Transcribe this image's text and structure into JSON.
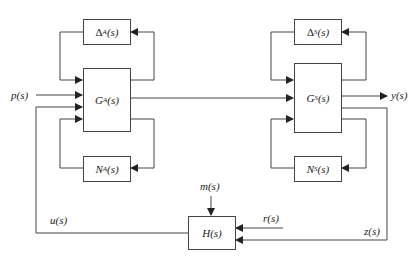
{
  "diagram": {
    "type": "block-diagram",
    "blocks": {
      "delta_a": {
        "prefix": "Δ",
        "sub": "A",
        "suffix": "(s)"
      },
      "g_a": {
        "prefix": "G",
        "sub": "A",
        "suffix": "(s)"
      },
      "n_a": {
        "prefix": "N",
        "sub": "A",
        "suffix": "(s)"
      },
      "delta_s": {
        "prefix": "Δ",
        "sub": "S",
        "suffix": "(s)"
      },
      "g_s": {
        "prefix": "G",
        "sub": "S",
        "suffix": "(s)"
      },
      "n_s": {
        "prefix": "N",
        "sub": "S",
        "suffix": "(s)"
      },
      "h": {
        "label": "H(s)"
      }
    },
    "signals": {
      "p": "p(s)",
      "y": "y(s)",
      "u": "u(s)",
      "m": "m(s)",
      "r": "r(s)",
      "z": "z(s)"
    },
    "colors": {
      "line": "#444444",
      "text": "#222222",
      "background": "#ffffff"
    }
  }
}
